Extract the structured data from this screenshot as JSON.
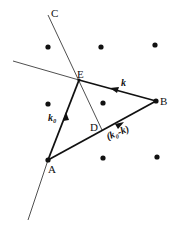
{
  "diagram": {
    "points": {
      "A": {
        "label": "A",
        "x": 48,
        "y": 160
      },
      "B": {
        "label": "B",
        "x": 156,
        "y": 101
      },
      "C": {
        "label": "C",
        "x": 48,
        "y": 15
      },
      "D": {
        "label": "D",
        "x": 102,
        "y": 130
      },
      "E": {
        "label": "E",
        "x": 79,
        "y": 80
      }
    },
    "vectors": {
      "k0": {
        "label": "k₀",
        "from": "A",
        "to": "E"
      },
      "k": {
        "label": "k",
        "from": "B",
        "to": "E"
      },
      "k0_minus_k": {
        "label": "(k₀-k)",
        "from": "A",
        "to": "B"
      }
    },
    "lattice_points": [
      {
        "x": 48,
        "y": 47
      },
      {
        "x": 101,
        "y": 47
      },
      {
        "x": 155,
        "y": 45
      },
      {
        "x": 48,
        "y": 104
      },
      {
        "x": 103,
        "y": 103
      },
      {
        "x": 103,
        "y": 158
      },
      {
        "x": 157,
        "y": 157
      }
    ],
    "colors": {
      "ink": "#111111",
      "background": "#ffffff"
    }
  }
}
